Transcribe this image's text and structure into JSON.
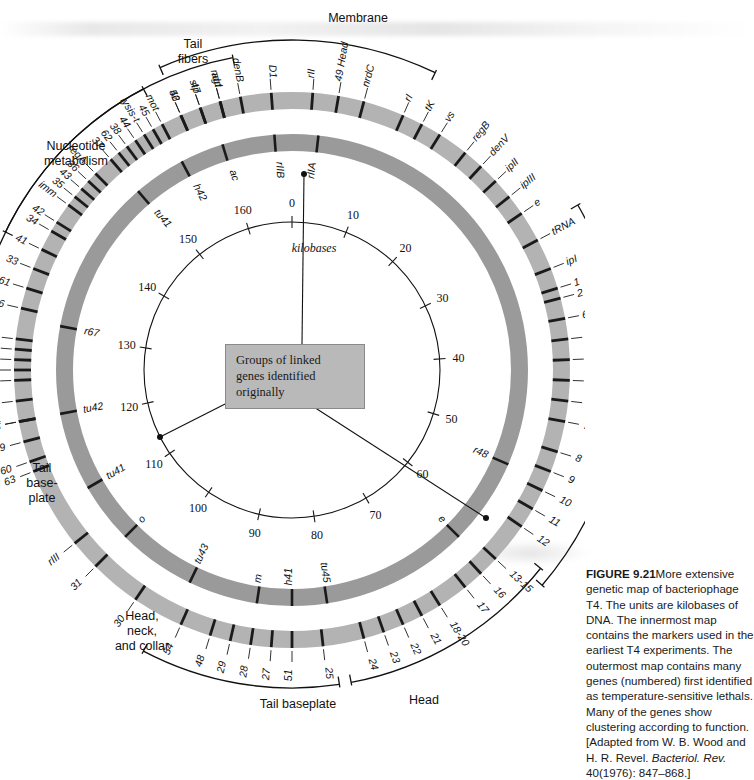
{
  "figure": {
    "center_note": "Groups of linked\ngenes identified\noriginally",
    "scale_unit": "kilobases"
  },
  "caption": {
    "label": "FIGURE 9.21",
    "text": "More extensive genetic map of bacteriophage T4. The units are kilobases of DNA. The innermost map contains the markers used in the earliest T4 experiments. The outermost map contains many genes (numbered) first identified as temperature-sensitive lethals. Many of the genes show clustering according to function. [Adapted from W. B. Wood and H. R. Revel. ",
    "journal": "Bacteriol. Rev.",
    "text2": " 40(1976): 847–868.]"
  },
  "scale_ring": {
    "ticks": [
      {
        "label": "0",
        "kb": 0
      },
      {
        "label": "10",
        "kb": 10
      },
      {
        "label": "20",
        "kb": 20
      },
      {
        "label": "30",
        "kb": 30
      },
      {
        "label": "40",
        "kb": 40
      },
      {
        "label": "50",
        "kb": 50
      },
      {
        "label": "60",
        "kb": 60
      },
      {
        "label": "70",
        "kb": 70
      },
      {
        "label": "80",
        "kb": 80
      },
      {
        "label": "90",
        "kb": 90
      },
      {
        "label": "100",
        "kb": 100
      },
      {
        "label": "110",
        "kb": 110
      },
      {
        "label": "120",
        "kb": 120
      },
      {
        "label": "130",
        "kb": 130
      },
      {
        "label": "140",
        "kb": 140
      },
      {
        "label": "150",
        "kb": 150
      },
      {
        "label": "160",
        "kb": 160
      }
    ],
    "total_kb": 168
  },
  "middle_ring": {
    "markers": [
      {
        "label": "rIIA",
        "kb": 3
      },
      {
        "label": "rIIB",
        "kb": 166
      },
      {
        "label": "ac",
        "kb": 160
      },
      {
        "label": "h42",
        "kb": 155
      },
      {
        "label": "tu41",
        "kb": 149
      },
      {
        "label": "r67",
        "kb": 131
      },
      {
        "label": "tu42",
        "kb": 121
      },
      {
        "label": "tu41",
        "kb": 112
      },
      {
        "label": "o",
        "kb": 105
      },
      {
        "label": "tu43",
        "kb": 96
      },
      {
        "label": "m",
        "kb": 88
      },
      {
        "label": "h41",
        "kb": 84
      },
      {
        "label": "tu45",
        "kb": 80
      },
      {
        "label": "e",
        "kb": 63
      },
      {
        "label": "r48",
        "kb": 53
      }
    ]
  },
  "outer_ring": {
    "markers": [
      {
        "label": "rII",
        "kb": 2
      },
      {
        "label": "D1",
        "kb": 166
      },
      {
        "label": "denB",
        "kb": 163
      },
      {
        "label": "ndd",
        "kb": 161
      },
      {
        "label": "stp",
        "kb": 159
      },
      {
        "label": "52",
        "kb": 157
      },
      {
        "label": "mot",
        "kb": 155
      },
      {
        "label": "lysis-t",
        "kb": 153
      },
      {
        "label": "38",
        "kb": 151
      },
      {
        "label": "37",
        "kb": 149
      },
      {
        "label": "36",
        "kb": 146
      },
      {
        "label": "35",
        "kb": 144
      },
      {
        "label": "34",
        "kb": 140
      },
      {
        "label": "33",
        "kb": 136
      },
      {
        "label": "frd",
        "kb": 129
      },
      {
        "label": "td",
        "kb": 127
      },
      {
        "label": "nrdA",
        "kb": 125
      },
      {
        "label": "nrdB",
        "kb": 123
      },
      {
        "label": "denA",
        "kb": 121
      },
      {
        "label": "63",
        "kb": 116
      },
      {
        "label": "rIII",
        "kb": 108
      },
      {
        "label": "31",
        "kb": 105
      },
      {
        "label": "30",
        "kb": 100
      },
      {
        "label": "54",
        "kb": 95
      },
      {
        "label": "48",
        "kb": 92
      },
      {
        "label": "29",
        "kb": 90
      },
      {
        "label": "28",
        "kb": 88
      },
      {
        "label": "27",
        "kb": 86
      },
      {
        "label": "51",
        "kb": 84
      },
      {
        "label": "25",
        "kb": 81
      },
      {
        "label": "24",
        "kb": 77
      },
      {
        "label": "23",
        "kb": 75
      },
      {
        "label": "22",
        "kb": 73
      },
      {
        "label": "21",
        "kb": 71
      },
      {
        "label": "18-20",
        "kb": 69
      },
      {
        "label": "17",
        "kb": 66
      },
      {
        "label": "16",
        "kb": 64
      },
      {
        "label": "13-15",
        "kb": 62
      },
      {
        "label": "12",
        "kb": 58
      },
      {
        "label": "11",
        "kb": 56
      },
      {
        "label": "10",
        "kb": 54
      },
      {
        "label": "9",
        "kb": 52
      },
      {
        "label": "8",
        "kb": 50
      },
      {
        "label": "7",
        "kb": 47
      },
      {
        "label": "6",
        "kb": 45
      },
      {
        "label": "5",
        "kb": 43
      },
      {
        "label": "4",
        "kb": 41
      },
      {
        "label": "65",
        "kb": 39
      },
      {
        "label": "64",
        "kb": 37
      },
      {
        "label": "2",
        "kb": 35
      },
      {
        "label": "1",
        "kb": 34
      },
      {
        "label": "ipI",
        "kb": 32
      },
      {
        "label": "tRNA",
        "kb": 29
      },
      {
        "label": "e",
        "kb": 26
      },
      {
        "label": "ipIII",
        "kb": 24
      },
      {
        "label": "ipII",
        "kb": 22
      },
      {
        "label": "denV",
        "kb": 20
      },
      {
        "label": "regB",
        "kb": 18
      },
      {
        "label": "vs",
        "kb": 15
      },
      {
        "label": "tK",
        "kb": 13
      },
      {
        "label": "rI",
        "kb": 11
      },
      {
        "label": "nrdC",
        "kb": 7
      },
      {
        "label": "49 Head",
        "kb": 4.5
      },
      {
        "label": "agt",
        "kb": 161
      },
      {
        "label": "47",
        "kb": 159
      },
      {
        "label": "46",
        "kb": 157
      },
      {
        "label": "45",
        "kb": 154
      },
      {
        "label": "44",
        "kb": 152
      },
      {
        "label": "62",
        "kb": 150
      },
      {
        "label": "regA",
        "kb": 147
      },
      {
        "label": "43",
        "kb": 145
      },
      {
        "label": "imm",
        "kb": 143
      },
      {
        "label": "42",
        "kb": 141
      },
      {
        "label": "41",
        "kb": 138
      },
      {
        "label": "58-61",
        "kb": 134
      },
      {
        "label": "56",
        "kb": 132
      },
      {
        "label": "mod",
        "kb": 128
      },
      {
        "label": "dda",
        "kb": 126
      },
      {
        "label": "cef",
        "kb": 121
      },
      {
        "label": "39",
        "kb": 119
      },
      {
        "label": "60",
        "kb": 117
      }
    ]
  },
  "group_brackets": [
    {
      "name": "Membrane",
      "text": "Membrane"
    },
    {
      "name": "Tail fibers",
      "text": "Tail\nfibers"
    },
    {
      "name": "Nucleotide metabolism",
      "text": "Nucleotide\nmetabolism"
    },
    {
      "name": "DNA synthesis, replication, and modification",
      "text": "DNA synthesis,\nreplication, and\nmodification"
    },
    {
      "name": "Tail baseplate left",
      "text": "Tail\nbase-\nplate"
    },
    {
      "name": "Head, neck, and collar",
      "text": "Head,\nneck,\nand collar"
    },
    {
      "name": "Tail baseplate bottom",
      "text": "Tail baseplate"
    },
    {
      "name": "Head",
      "text": "Head"
    }
  ],
  "colors": {
    "ring_outer": "#b3b3b3",
    "ring_middle": "#9a9a9a",
    "tick": "#1a1a1a",
    "center_box": "#b9b9b9",
    "page": "#ffffff"
  }
}
